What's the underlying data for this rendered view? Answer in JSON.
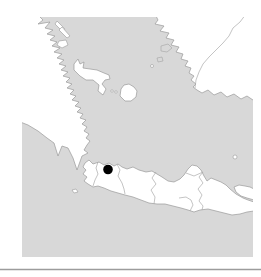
{
  "figure": {
    "kind": "locality-dot-map",
    "features": [
      "sumatra",
      "bangka",
      "belitung",
      "borneo",
      "java",
      "madura",
      "bawean",
      "panaitan",
      "java-sea",
      "indian-ocean"
    ],
    "marker_count": 1
  },
  "map": {
    "x": 22,
    "y": 17,
    "w": 231,
    "h": 240
  },
  "marker": {
    "x": 108,
    "y": 169.5,
    "r": 4.8
  },
  "divider": {
    "x1": 0,
    "y1": 269.5,
    "x2": 261,
    "y2": 269.5
  },
  "colors": {
    "background": "#ffffff",
    "sea": "#d8d8d8",
    "land": "#ffffff",
    "coastline": "#999999",
    "province_border": "#ababab",
    "marker": "#000000",
    "divider": "#9c9c9c"
  }
}
